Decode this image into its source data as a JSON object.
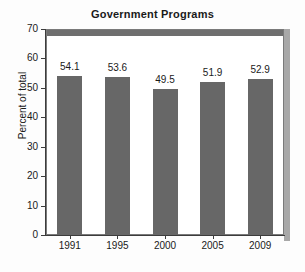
{
  "chart_data": {
    "type": "bar",
    "title": "Government Programs",
    "xlabel": "",
    "ylabel": "Percent of total",
    "categories": [
      "1991",
      "1995",
      "2000",
      "2005",
      "2009"
    ],
    "values": [
      54.1,
      53.6,
      49.5,
      51.9,
      52.9
    ],
    "value_labels": [
      "54.1",
      "53.6",
      "49.5",
      "51.9",
      "52.9"
    ],
    "ylim": [
      0,
      70
    ],
    "ytick_labels": [
      "70",
      "60",
      "50",
      "40",
      "30",
      "20",
      "10",
      "0"
    ],
    "ytick_values": [
      70,
      60,
      50,
      40,
      30,
      20,
      10,
      0
    ],
    "grid": false,
    "legend": false,
    "bar_color": "#676767",
    "frame_color": "#7a7a7a",
    "shadow_color": "#a8a8a8",
    "top_band_color": "#6e6e6e",
    "background_color": "#ffffff",
    "text_color": "#1a1a1a"
  }
}
